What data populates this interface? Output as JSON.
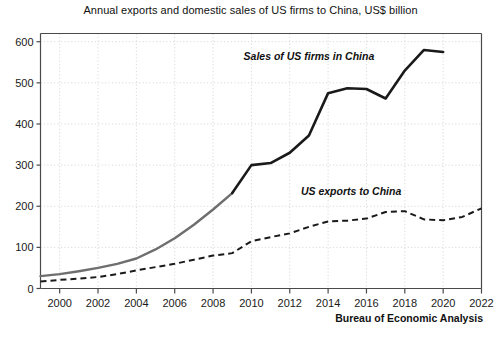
{
  "chart_data": {
    "type": "line",
    "title": "Annual exports and domestic sales of US firms to China, US$ billion",
    "xlabel": "",
    "ylabel": "",
    "xlim": [
      1999,
      2022
    ],
    "ylim": [
      0,
      620
    ],
    "grid": true,
    "legend_position": "inline-annotation",
    "x_ticks": [
      2000,
      2002,
      2004,
      2006,
      2008,
      2010,
      2012,
      2014,
      2016,
      2018,
      2020,
      2022
    ],
    "y_ticks": [
      0,
      100,
      200,
      300,
      400,
      500,
      600
    ],
    "source": "Bureau of Economic Analysis",
    "series": [
      {
        "name": "Sales of US firms in China",
        "style": "solid",
        "color": "#1a1a1a",
        "early_color": "#6e6e6e",
        "x": [
          1999,
          2000,
          2001,
          2002,
          2003,
          2004,
          2005,
          2006,
          2007,
          2008,
          2009,
          2010,
          2011,
          2012,
          2013,
          2014,
          2015,
          2016,
          2017,
          2018,
          2019,
          2020
        ],
        "values": [
          30,
          35,
          42,
          50,
          60,
          73,
          95,
          122,
          155,
          192,
          232,
          300,
          305,
          330,
          372,
          475,
          487,
          485,
          462,
          530,
          580,
          575
        ]
      },
      {
        "name": "US exports to China",
        "style": "dashed",
        "color": "#1a1a1a",
        "x": [
          1999,
          2000,
          2001,
          2002,
          2003,
          2004,
          2005,
          2006,
          2007,
          2008,
          2009,
          2010,
          2011,
          2012,
          2013,
          2014,
          2015,
          2016,
          2017,
          2018,
          2019,
          2020,
          2021,
          2022
        ],
        "values": [
          17,
          21,
          24,
          28,
          35,
          44,
          52,
          60,
          70,
          80,
          86,
          115,
          125,
          134,
          150,
          163,
          165,
          170,
          186,
          188,
          168,
          166,
          174,
          195
        ]
      }
    ],
    "annotations": [
      {
        "text": "Sales of US firms in China",
        "x": 2013.0,
        "y": 555
      },
      {
        "text": "US exports to China",
        "x": 2015.2,
        "y": 228
      }
    ]
  }
}
